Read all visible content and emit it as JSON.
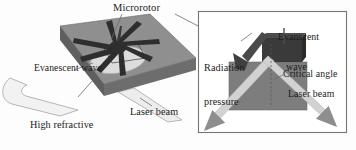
{
  "figure": {
    "type": "schematic-diagram",
    "colors": {
      "background": "#fdfdfd",
      "prism_top": "#8d8d8d",
      "prism_front": "#6f6f6f",
      "prism_side": "#5c5c5c",
      "rotor": "#2f2f2f",
      "evanescent_spot": "#d8d8d8",
      "beam": "#cfcfcf",
      "beam_outline": "#9a9a9a",
      "inset_border": "#7a7a7a",
      "inset_block": "#7b7b7b",
      "inset_rotor": "#3a3a3a",
      "arrow": "#4a4a4a",
      "leader_line": "#6b6b6b",
      "text": "#1b1b1b"
    }
  },
  "main_panel": {
    "name": "perspective-view",
    "labels": {
      "microrotor": "Microrotor",
      "evanescent_wave": "Evanescent wave",
      "prism_line1": "High refractive",
      "prism_line2": "index prism",
      "laser_beam": "Laser beam"
    }
  },
  "inset_panel": {
    "name": "cross-section-detail",
    "labels": {
      "evanescent_line1": "Evanscent",
      "evanescent_line2": "wave",
      "radiation_line1": "Radiation",
      "radiation_line2": "pressure",
      "critical_angle": "Critical angle",
      "laser_beam": "Laser beam"
    }
  }
}
